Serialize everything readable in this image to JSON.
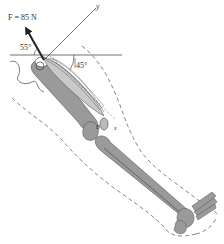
{
  "diagram": {
    "type": "free-body diagram of leg",
    "force_label": "F = 85 N",
    "force_angle_label": "55°",
    "muscle_angle_label": "45°",
    "y_axis_label": "y",
    "x_axis_label": "x",
    "knee_point_label": "B",
    "colors": {
      "bone_fill": "#9a9a9a",
      "bone_stroke": "#555555",
      "outline": "#666666",
      "ink": "#222222"
    }
  }
}
